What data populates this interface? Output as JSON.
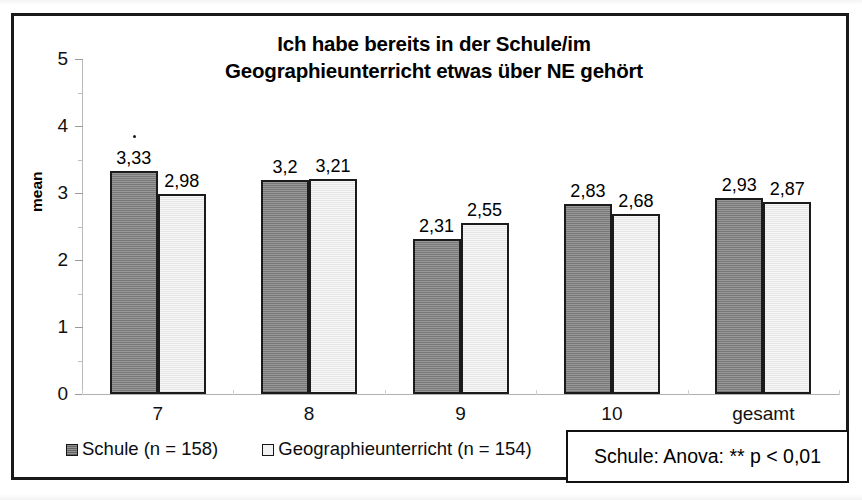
{
  "chart_data": {
    "type": "bar",
    "title": "Ich habe bereits in der Schule/im Geographieunterricht etwas über NE gehört",
    "title_lines": [
      "Ich habe bereits in der Schule/im",
      "Geographieunterricht etwas über NE gehört"
    ],
    "xlabel": "",
    "ylabel": "mean",
    "ylim": [
      0,
      5
    ],
    "ytick_labels": [
      "0",
      "1",
      "2",
      "3",
      "4",
      "5"
    ],
    "ytick_values": [
      0,
      1,
      2,
      3,
      4,
      5
    ],
    "yminor_values": [
      0.5,
      1.5,
      2.5,
      3.5,
      4.5
    ],
    "grid": false,
    "legend_position": "bottom",
    "categories": [
      "7",
      "8",
      "9",
      "10",
      "gesamt"
    ],
    "series": [
      {
        "name": "Schule (n = 158)",
        "color": "#7f7f7f",
        "values": [
          3.33,
          3.2,
          2.83,
          2.83,
          2.93
        ],
        "value_labels": [
          "3,33",
          "3,2",
          "2,31",
          "2,83",
          "2,93"
        ]
      },
      {
        "name": "Geographieunterricht (n = 154)",
        "color": "#ededed",
        "values": [
          2.98,
          3.21,
          2.55,
          2.68,
          2.87
        ],
        "value_labels": [
          "2,98",
          "3,21",
          "2,55",
          "2,68",
          "2,87"
        ]
      }
    ],
    "plot_values": {
      "series_0": [
        3.33,
        3.2,
        2.31,
        2.83,
        2.93
      ],
      "series_1": [
        2.98,
        3.21,
        2.55,
        2.68,
        2.87
      ]
    },
    "annotations": [
      {
        "text": "Schule: Anova: ** p < 0,01",
        "kind": "footnote-box"
      },
      {
        "text": "·",
        "kind": "significance-marker",
        "attached_to": "series_0 category 7"
      }
    ]
  },
  "legend": {
    "entries": [
      {
        "label": "Schule (n = 158)",
        "swatch": "dark-gray-square"
      },
      {
        "label": "Geographieunterricht (n = 154)",
        "swatch": "light-gray-square"
      }
    ]
  },
  "footnote": {
    "text": "Schule: Anova: ** p < 0,01"
  },
  "axis": {
    "y_title": "mean"
  },
  "colors": {
    "series_1_fill": "#7f7f7f",
    "series_2_fill": "#ededed",
    "bar_border": "#1b1b1b",
    "frame": "#1a1a1a",
    "text": "#000000"
  }
}
